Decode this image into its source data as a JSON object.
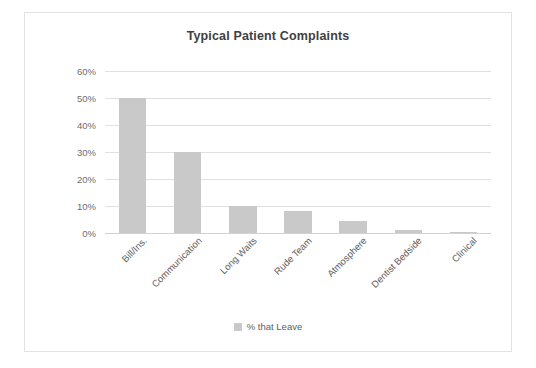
{
  "chart_data": {
    "type": "bar",
    "title": "Typical Patient Complaints",
    "xlabel": "",
    "ylabel": "",
    "categories": [
      "Bill/Ins.",
      "Communication",
      "Long Waits",
      "Rude Team",
      "Atmosphere",
      "Dentist Bedside",
      "Clinical"
    ],
    "values": [
      50,
      30,
      10,
      8,
      4.5,
      1,
      0.3
    ],
    "series": [
      {
        "name": "% that Leave",
        "values": [
          50,
          30,
          10,
          8,
          4.5,
          1,
          0.3
        ]
      }
    ],
    "ylim": [
      0,
      60
    ],
    "yticks": [
      0,
      10,
      20,
      30,
      40,
      50,
      60
    ],
    "ytick_labels": [
      "0%",
      "10%",
      "20%",
      "30%",
      "40%",
      "50%",
      "60%"
    ],
    "grid": true,
    "legend": {
      "position": "bottom",
      "entries": [
        "% that Leave"
      ]
    },
    "bar_color": "#c9c9c9",
    "gridline_color": "#e0e0e0",
    "text_color": "#5e5e5e",
    "title_color": "#3f3f3f",
    "frame_color": "#e3e3e3"
  }
}
